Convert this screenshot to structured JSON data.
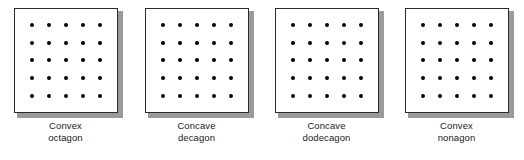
{
  "figure": {
    "type": "dot-grid-panels",
    "panel_count": 4,
    "grid_rows": 5,
    "grid_cols": 5,
    "dot_color": "#000000",
    "box_border_color": "#2b2b2b",
    "box_fill_color": "#ffffff",
    "shadow_color": "#9a9a9a",
    "background_color": "#ffffff"
  },
  "panels": [
    {
      "caption_line1": "Convex",
      "caption_line2": "octagon",
      "caption_full": "Convex octagon",
      "rows": 5,
      "cols": 5
    },
    {
      "caption_line1": "Concave",
      "caption_line2": "decagon",
      "caption_full": "Concave decagon",
      "rows": 5,
      "cols": 5
    },
    {
      "caption_line1": "Concave",
      "caption_line2": "dodecagon",
      "caption_full": "Concave dodecagon",
      "rows": 5,
      "cols": 5
    },
    {
      "caption_line1": "Convex",
      "caption_line2": "nonagon",
      "caption_full": "Convex nonagon",
      "rows": 5,
      "cols": 5
    }
  ]
}
